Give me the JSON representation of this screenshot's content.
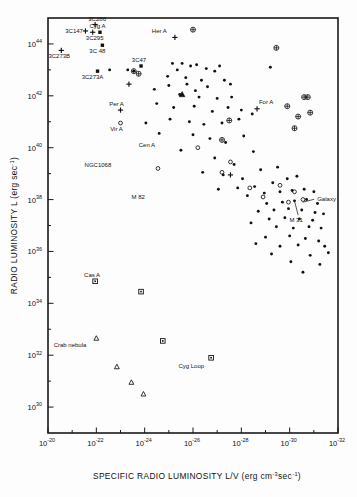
{
  "figure": {
    "title": "",
    "background": "#fdfdfd",
    "ink_color": "#111111"
  },
  "chart_data": {
    "type": "scatter",
    "title": "",
    "subtitle": "",
    "xlabel": "SPECIFIC RADIO LUMINOSITY  L/V (erg cm⁻³sec⁻¹)",
    "ylabel": "RADIO LUMINOSITY  L (erg sec⁻¹)",
    "xscale": "log",
    "yscale": "log",
    "xlim_exp": [
      -20,
      -32
    ],
    "ylim_exp": [
      29,
      45
    ],
    "x_tick_labels": [
      "10⁻²⁰",
      "10⁻²²",
      "10⁻²⁴",
      "10⁻²⁶",
      "10⁻²⁸",
      "10⁻³⁰",
      "10⁻³²"
    ],
    "x_tick_exps": [
      -20,
      -22,
      -24,
      -26,
      -28,
      -30,
      -32
    ],
    "y_tick_labels": [
      "10³⁰",
      "10³²",
      "10³⁴",
      "10³⁶",
      "10³⁸",
      "10⁴⁰",
      "10⁴²",
      "10⁴⁴"
    ],
    "y_tick_exps": [
      30,
      32,
      34,
      36,
      38,
      40,
      42,
      44
    ],
    "x_minor_exps": [
      -21,
      -23,
      -25,
      -27,
      -29,
      -31
    ],
    "y_minor_exps": [
      31,
      33,
      35,
      37,
      39,
      41,
      43
    ],
    "grid": false,
    "legend": "none",
    "marker_types": [
      "dot",
      "open-circle",
      "cross",
      "circle-cross",
      "square",
      "triangle",
      "filled-triangle",
      "filled-square"
    ],
    "annotations": [
      {
        "label": "3C273B",
        "x_exp": -20.55,
        "y_exp": 43.75,
        "marker": "cross",
        "dx": -2,
        "dy": 8
      },
      {
        "label": "3C286",
        "x_exp": -21.95,
        "y_exp": 44.75,
        "marker": "cross",
        "dx": 2,
        "dy": -3
      },
      {
        "label": "3C147",
        "x_exp": -22.15,
        "y_exp": 44.45,
        "marker": "filled-square",
        "dx": -17,
        "dy": 1
      },
      {
        "label": "3C295",
        "x_exp": -21.85,
        "y_exp": 44.45,
        "marker": "cross",
        "dx": 2,
        "dy": 8
      },
      {
        "label": "Cyg A",
        "x_exp": -21.55,
        "y_exp": 44.5,
        "marker": "cross",
        "dx": 4,
        "dy": -3
      },
      {
        "label": "3C 48",
        "x_exp": -22.25,
        "y_exp": 43.95,
        "marker": "filled-square",
        "dx": -5,
        "dy": 8
      },
      {
        "label": "3C273A",
        "x_exp": -22.05,
        "y_exp": 42.95,
        "marker": "filled-square",
        "dx": -5,
        "dy": 8
      },
      {
        "label": "3C47",
        "x_exp": -23.85,
        "y_exp": 43.15,
        "marker": "filled-square",
        "dx": -2,
        "dy": -4
      },
      {
        "label": "Her A",
        "x_exp": -25.25,
        "y_exp": 44.25,
        "marker": "cross",
        "dx": -8,
        "dy": -4
      },
      {
        "label": "For A",
        "x_exp": -29.9,
        "y_exp": 41.6,
        "marker": "circle-cross",
        "dx": -14,
        "dy": -2
      },
      {
        "label": "Per A",
        "x_exp": -23.0,
        "y_exp": 41.45,
        "marker": "cross",
        "dx": -4,
        "dy": -4
      },
      {
        "label": "Vir A",
        "x_exp": -23.0,
        "y_exp": 40.95,
        "marker": "open-circle",
        "dx": -4,
        "dy": 8
      },
      {
        "label": "Cen A",
        "x_exp": -24.3,
        "y_exp": 40.35,
        "marker": "dot",
        "dx": -5,
        "dy": 8
      },
      {
        "label": "NGC1068",
        "x_exp": -22.95,
        "y_exp": 39.6,
        "marker": "dot",
        "dx": -8,
        "dy": 9
      },
      {
        "label": "M 82",
        "x_exp": -23.9,
        "y_exp": 38.35,
        "marker": "dot",
        "dx": -4,
        "dy": 9
      },
      {
        "label": "M 31",
        "x_exp": -30.35,
        "y_exp": 37.55,
        "marker": "dot",
        "dx": -2,
        "dy": 11
      },
      {
        "label": "Galaxy",
        "x_exp": -30.85,
        "y_exp": 38.05,
        "marker": "dot",
        "dx": 7,
        "dy": 3
      },
      {
        "label": "Cas A",
        "x_exp": -21.95,
        "y_exp": 34.85,
        "marker": "square",
        "dx": -3,
        "dy": -4
      },
      {
        "label": "Crab nebula",
        "x_exp": -22.0,
        "y_exp": 32.65,
        "marker": "triangle",
        "dx": -10,
        "dy": 9
      },
      {
        "label": "Cyg Loop",
        "x_exp": -26.75,
        "y_exp": 31.9,
        "marker": "square",
        "dx": -7,
        "dy": 10
      }
    ],
    "series": [
      {
        "name": "radio sources (filled dots)",
        "marker": "dot",
        "points": [
          [
            -22.55,
            43.0
          ],
          [
            -23.3,
            43.0
          ],
          [
            -23.55,
            42.95
          ],
          [
            -25.55,
            43.25
          ],
          [
            -25.15,
            43.25
          ],
          [
            -25.9,
            43.15
          ],
          [
            -25.35,
            43.0
          ],
          [
            -26.15,
            43.2
          ],
          [
            -26.55,
            43.05
          ],
          [
            -24.95,
            42.75
          ],
          [
            -25.7,
            42.7
          ],
          [
            -26.9,
            42.95
          ],
          [
            -27.1,
            43.15
          ],
          [
            -26.35,
            42.6
          ],
          [
            -25.0,
            42.4
          ],
          [
            -25.75,
            42.45
          ],
          [
            -26.6,
            42.35
          ],
          [
            -27.3,
            42.6
          ],
          [
            -24.4,
            42.25
          ],
          [
            -26.1,
            42.2
          ],
          [
            -27.55,
            42.45
          ],
          [
            -29.2,
            43.1
          ],
          [
            -25.45,
            42.05
          ],
          [
            -26.25,
            41.95
          ],
          [
            -27.0,
            41.9
          ],
          [
            -27.6,
            41.95
          ],
          [
            -24.5,
            41.7
          ],
          [
            -25.2,
            41.55
          ],
          [
            -26.05,
            41.6
          ],
          [
            -26.8,
            41.4
          ],
          [
            -27.45,
            41.55
          ],
          [
            -28.0,
            41.45
          ],
          [
            -25.05,
            41.1
          ],
          [
            -25.85,
            41.0
          ],
          [
            -26.45,
            40.9
          ],
          [
            -27.2,
            40.95
          ],
          [
            -27.9,
            41.1
          ],
          [
            -28.45,
            41.3
          ],
          [
            -24.05,
            40.95
          ],
          [
            -24.6,
            40.55
          ],
          [
            -26.0,
            40.5
          ],
          [
            -26.7,
            40.35
          ],
          [
            -27.35,
            40.2
          ],
          [
            -28.1,
            40.45
          ],
          [
            -25.5,
            39.9
          ],
          [
            -26.9,
            39.6
          ],
          [
            -27.7,
            39.35
          ],
          [
            -28.5,
            39.85
          ],
          [
            -26.4,
            39.05
          ],
          [
            -27.25,
            38.95
          ],
          [
            -28.05,
            38.8
          ],
          [
            -28.8,
            39.15
          ],
          [
            -29.5,
            39.25
          ],
          [
            -27.05,
            38.4
          ],
          [
            -27.85,
            38.45
          ],
          [
            -28.55,
            38.5
          ],
          [
            -29.3,
            38.65
          ],
          [
            -29.9,
            38.8
          ],
          [
            -30.3,
            38.9
          ],
          [
            -28.25,
            38.15
          ],
          [
            -28.95,
            38.25
          ],
          [
            -29.6,
            38.3
          ],
          [
            -30.1,
            38.35
          ],
          [
            -30.6,
            38.4
          ],
          [
            -31.0,
            38.3
          ],
          [
            -29.05,
            37.85
          ],
          [
            -29.7,
            37.9
          ],
          [
            -30.2,
            37.95
          ],
          [
            -30.7,
            38.0
          ],
          [
            -31.15,
            37.85
          ],
          [
            -28.7,
            37.55
          ],
          [
            -29.35,
            37.6
          ],
          [
            -29.95,
            37.65
          ],
          [
            -30.5,
            37.6
          ],
          [
            -31.05,
            37.5
          ],
          [
            -29.15,
            37.25
          ],
          [
            -29.8,
            37.3
          ],
          [
            -30.4,
            37.25
          ],
          [
            -30.95,
            37.2
          ],
          [
            -31.4,
            37.45
          ],
          [
            -28.4,
            37.1
          ],
          [
            -29.45,
            36.95
          ],
          [
            -30.15,
            36.9
          ],
          [
            -30.8,
            36.95
          ],
          [
            -31.3,
            36.9
          ],
          [
            -29.0,
            36.55
          ],
          [
            -30.0,
            36.6
          ],
          [
            -30.65,
            36.5
          ],
          [
            -31.2,
            36.4
          ],
          [
            -28.6,
            36.3
          ],
          [
            -29.6,
            36.2
          ],
          [
            -30.35,
            36.25
          ],
          [
            -31.45,
            36.2
          ],
          [
            -29.25,
            35.9
          ],
          [
            -30.85,
            35.85
          ],
          [
            -31.6,
            35.95
          ],
          [
            -30.05,
            35.6
          ],
          [
            -31.25,
            35.5
          ],
          [
            -30.55,
            35.2
          ]
        ]
      },
      {
        "name": "open circles",
        "marker": "open-circle",
        "points": [
          [
            -23.0,
            40.95
          ],
          [
            -26.2,
            40.0
          ],
          [
            -27.55,
            39.45
          ],
          [
            -24.55,
            39.2
          ],
          [
            -27.2,
            39.05
          ],
          [
            -28.35,
            38.45
          ],
          [
            -29.6,
            38.55
          ],
          [
            -30.2,
            38.3
          ],
          [
            -30.55,
            38.0
          ],
          [
            -29.95,
            37.9
          ],
          [
            -28.9,
            38.1
          ]
        ]
      },
      {
        "name": "crosses",
        "marker": "cross",
        "points": [
          [
            -20.55,
            43.75
          ],
          [
            -21.95,
            44.75
          ],
          [
            -21.85,
            44.45
          ],
          [
            -21.55,
            44.5
          ],
          [
            -23.35,
            42.45
          ],
          [
            -25.25,
            44.25
          ],
          [
            -23.0,
            41.45
          ],
          [
            -28.65,
            41.5
          ],
          [
            -27.55,
            38.95
          ]
        ]
      },
      {
        "name": "circled crosses",
        "marker": "circle-cross",
        "points": [
          [
            -23.55,
            42.95
          ],
          [
            -23.75,
            42.85
          ],
          [
            -26.0,
            44.55
          ],
          [
            -29.45,
            43.85
          ],
          [
            -30.6,
            41.95
          ],
          [
            -30.75,
            41.95
          ],
          [
            -29.9,
            41.6
          ],
          [
            -30.35,
            41.2
          ],
          [
            -30.85,
            41.35
          ],
          [
            -30.2,
            40.75
          ],
          [
            -27.5,
            41.05
          ],
          [
            -27.2,
            40.3
          ]
        ]
      },
      {
        "name": "filled squares (quasars)",
        "marker": "filled-square",
        "points": [
          [
            -22.15,
            44.45
          ],
          [
            -22.25,
            43.95
          ],
          [
            -22.05,
            42.95
          ],
          [
            -23.85,
            43.15
          ]
        ]
      },
      {
        "name": "filled triangle",
        "marker": "filled-triangle",
        "points": [
          [
            -25.55,
            42.05
          ]
        ]
      },
      {
        "name": "supernova remnants (squares)",
        "marker": "square",
        "points": [
          [
            -21.95,
            34.85
          ],
          [
            -23.85,
            34.45
          ],
          [
            -24.75,
            32.55
          ],
          [
            -26.75,
            31.9
          ]
        ]
      },
      {
        "name": "HII / nebulae (triangles)",
        "marker": "triangle",
        "points": [
          [
            -22.0,
            32.65
          ],
          [
            -22.85,
            31.55
          ],
          [
            -23.45,
            30.95
          ],
          [
            -23.95,
            30.5
          ]
        ]
      }
    ]
  }
}
